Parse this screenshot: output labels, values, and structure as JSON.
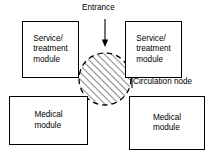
{
  "diagram": {
    "title": "Entrance",
    "modules": [
      {
        "id": "service-treatment-top-left",
        "label": "Service/\ntreatment\nmodule"
      },
      {
        "id": "service-treatment-top-right",
        "label": "Service/\ntreatment\nmodule"
      },
      {
        "id": "medical-bottom-left",
        "label": "Medical\nmodule"
      },
      {
        "id": "medical-bottom-right",
        "label": "Medical\nmodule"
      }
    ],
    "annotations": {
      "entrance": "Entrance",
      "circulation_node": "Circulation node"
    },
    "colors": {
      "stroke": "#000000",
      "background": "#ffffff",
      "hatch": "#000000"
    }
  }
}
